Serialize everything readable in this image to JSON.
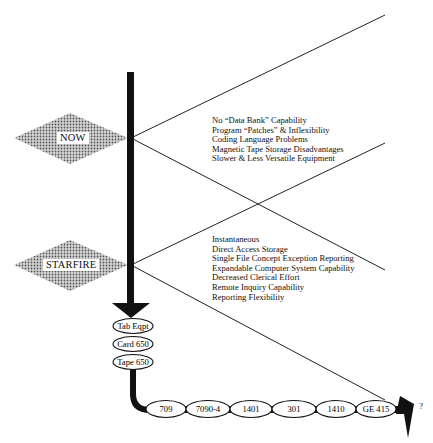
{
  "diagram": {
    "now": {
      "label": "NOW",
      "items": [
        "No “Data Bank” Capability",
        "Program “Patches” & Inflexibility",
        "Coding Language Problems",
        "Magnetic Tape Storage Disadvantages",
        "Slower & Less Versatile Equipment"
      ]
    },
    "starfire": {
      "label": "STARFIRE",
      "items": [
        "Instantaneous",
        "Direct Access Storage",
        "Single File Concept Exception Reporting",
        "Expandable Computer System Capability",
        "Decreased Clerical Effort",
        "Remote Inquiry Capability",
        "Reporting Flexibility"
      ]
    },
    "vertical_stages": [
      "Tab Eqpt",
      "Card 650",
      "Tape 650"
    ],
    "horizontal_stages": [
      "709",
      "7090-4",
      "1401",
      "301",
      "1410",
      "GE 415"
    ],
    "end_label": "?",
    "colors": {
      "line": "#111111",
      "diamond_fill": "#9a9a9a",
      "background": "#ffffff"
    }
  }
}
